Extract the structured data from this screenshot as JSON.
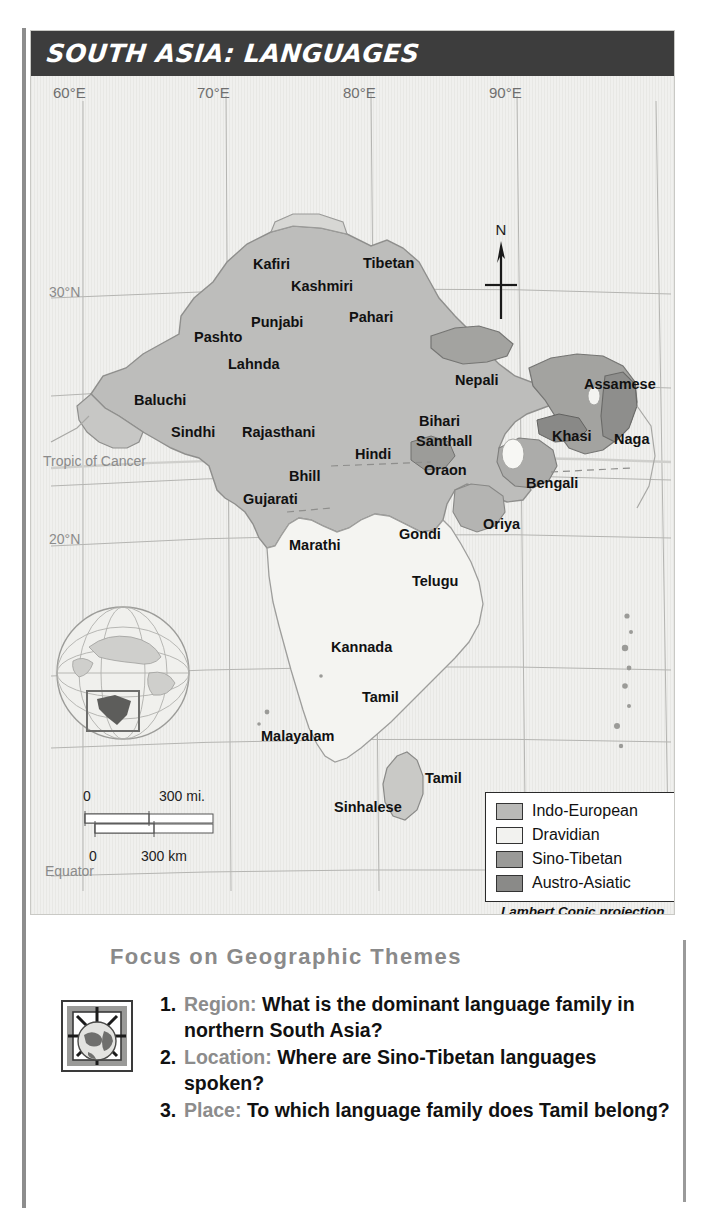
{
  "map": {
    "title": "SOUTH ASIA:  LANGUAGES",
    "longitude_labels": [
      "60°E",
      "70°E",
      "80°E",
      "90°E"
    ],
    "latitude_labels": [
      "30°N",
      "Tropic of Cancer",
      "20°N",
      "Equator"
    ],
    "compass_label": "N",
    "projection_note": "Lambert Conic projection",
    "scale": {
      "miles_zero": "0",
      "miles_max": "300 mi.",
      "km_zero": "0",
      "km_max": "300 km"
    },
    "legend": {
      "items": [
        {
          "label": "Indo-European",
          "color": "#b9b9b7"
        },
        {
          "label": "Dravidian",
          "color": "#f2f2ef"
        },
        {
          "label": "Sino-Tibetan",
          "color": "#9a9a98"
        },
        {
          "label": "Austro-Asiatic",
          "color": "#8a8a88"
        }
      ]
    },
    "language_labels": [
      {
        "name": "Kafiri",
        "x": 222,
        "y": 180
      },
      {
        "name": "Tibetan",
        "x": 332,
        "y": 179
      },
      {
        "name": "Kashmiri",
        "x": 260,
        "y": 202
      },
      {
        "name": "Punjabi",
        "x": 220,
        "y": 238
      },
      {
        "name": "Pahari",
        "x": 318,
        "y": 233
      },
      {
        "name": "Pashto",
        "x": 163,
        "y": 253
      },
      {
        "name": "Lahnda",
        "x": 197,
        "y": 280
      },
      {
        "name": "Nepali",
        "x": 424,
        "y": 296
      },
      {
        "name": "Assamese",
        "x": 557,
        "y": 300
      },
      {
        "name": "Baluchi",
        "x": 103,
        "y": 316
      },
      {
        "name": "Bihari",
        "x": 388,
        "y": 337
      },
      {
        "name": "Sindhi",
        "x": 140,
        "y": 348
      },
      {
        "name": "Rajasthani",
        "x": 211,
        "y": 348
      },
      {
        "name": "Santhall",
        "x": 385,
        "y": 357
      },
      {
        "name": "Khasi",
        "x": 524,
        "y": 352
      },
      {
        "name": "Naga",
        "x": 586,
        "y": 355
      },
      {
        "name": "Hindi",
        "x": 324,
        "y": 370
      },
      {
        "name": "Oraon",
        "x": 393,
        "y": 386
      },
      {
        "name": "Bhill",
        "x": 258,
        "y": 392
      },
      {
        "name": "Bengali",
        "x": 498,
        "y": 399
      },
      {
        "name": "Gujarati",
        "x": 212,
        "y": 415
      },
      {
        "name": "Oriya",
        "x": 452,
        "y": 440
      },
      {
        "name": "Gondi",
        "x": 368,
        "y": 450
      },
      {
        "name": "Marathi",
        "x": 260,
        "y": 461
      },
      {
        "name": "Telugu",
        "x": 381,
        "y": 497
      },
      {
        "name": "Kannada",
        "x": 302,
        "y": 563
      },
      {
        "name": "Tamil",
        "x": 331,
        "y": 613
      },
      {
        "name": "Malayalam",
        "x": 233,
        "y": 652
      },
      {
        "name": "Tamil",
        "x": 394,
        "y": 694
      },
      {
        "name": "Sinhalese",
        "x": 305,
        "y": 723
      }
    ]
  },
  "focus": {
    "title": "Focus on Geographic Themes",
    "questions": [
      {
        "num": "1.",
        "theme": "Region:",
        "text": "What is the dominant language family in northern South Asia?"
      },
      {
        "num": "2.",
        "theme": "Location:",
        "text": "Where are Sino-Tibetan languages spoken?"
      },
      {
        "num": "3.",
        "theme": "Place:",
        "text": "To which language family does Tamil belong?"
      }
    ]
  }
}
